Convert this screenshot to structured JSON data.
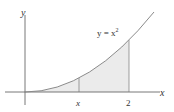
{
  "diagram": {
    "function_label": "y = x",
    "function_exponent": "2",
    "axes": {
      "x_label": "x",
      "y_label": "y"
    },
    "ticks": [
      {
        "label": "x",
        "italic": true,
        "value": 1.04
      },
      {
        "label": "2",
        "italic": false,
        "value": 2
      }
    ],
    "shaded_region": {
      "from": 0,
      "to": 2,
      "color": "#ebebeb"
    },
    "colors": {
      "axis": "#555555",
      "curve": "#8a8a8a",
      "fill": "#ebebeb"
    }
  }
}
